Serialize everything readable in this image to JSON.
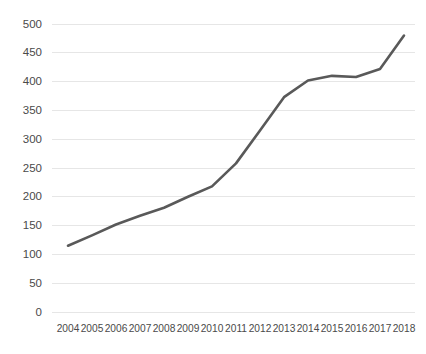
{
  "chart_data": {
    "type": "line",
    "title": "",
    "subtitle": "",
    "xlabel": "",
    "ylabel": "",
    "categories": [
      "2004",
      "2005",
      "2006",
      "2007",
      "2008",
      "2009",
      "2010",
      "2011",
      "2012",
      "2013",
      "2014",
      "2015",
      "2016",
      "2017",
      "2018"
    ],
    "values": [
      115,
      133,
      152,
      167,
      181,
      200,
      218,
      258,
      315,
      373,
      402,
      410,
      408,
      422,
      480
    ],
    "series": [
      {
        "name": "",
        "values": [
          115,
          133,
          152,
          167,
          181,
          200,
          218,
          258,
          315,
          373,
          402,
          410,
          408,
          422,
          480
        ]
      }
    ],
    "ylim": [
      0,
      500
    ],
    "ytick_values": [
      0,
      50,
      100,
      150,
      200,
      250,
      300,
      350,
      400,
      450,
      500
    ],
    "ytick_labels": [
      "0",
      "50",
      "100",
      "150",
      "200",
      "250",
      "300",
      "350",
      "400",
      "450",
      "500"
    ],
    "xtick_labels": [
      "2004",
      "2005",
      "2006",
      "2007",
      "2008",
      "2009",
      "2010",
      "2011",
      "2012",
      "2013",
      "2014",
      "2015",
      "2016",
      "2017",
      "2018"
    ],
    "grid": {
      "horizontal": true,
      "vertical": false
    },
    "legend": {
      "visible": false,
      "position": "none",
      "entries": []
    },
    "annotations": [],
    "colors": {
      "line": "#595959",
      "gridline": "#e6e6e6",
      "tick_text": "#4a4a4a",
      "background": "#ffffff"
    }
  }
}
